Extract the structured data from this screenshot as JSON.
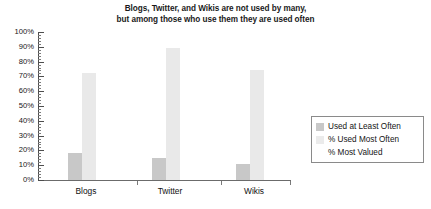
{
  "chart_data": {
    "type": "bar",
    "title": "Blogs, Twitter, and Wikis are not used by many, but among those who use them they are used often",
    "title_lines": [
      "Blogs, Twitter, and Wikis are not used by many,",
      "but among those who use them they are used often"
    ],
    "categories": [
      "Blogs",
      "Twitter",
      "Wikis"
    ],
    "series": [
      {
        "name": "Used at Least Often",
        "color": "#c8c8c8",
        "values": [
          18,
          15,
          11
        ]
      },
      {
        "name": "% Used Most Often",
        "color": "#e9e9e9",
        "values": [
          72,
          89,
          74
        ]
      },
      {
        "name": "% Most Valued",
        "color": "#ffffff",
        "values": [
          0,
          0,
          0
        ]
      }
    ],
    "xlabel": "",
    "ylabel": "",
    "ylim": [
      0,
      100
    ],
    "ytick_labels": [
      "100%",
      "90%",
      "80%",
      "70%",
      "60%",
      "50%",
      "40%",
      "30%",
      "20%",
      "10%",
      "0%"
    ],
    "ytick_values": [
      100,
      90,
      80,
      70,
      60,
      50,
      40,
      30,
      20,
      10,
      0
    ],
    "yminor_step": 2,
    "grid": false,
    "legend_position": "right"
  },
  "legend": {
    "entries": [
      {
        "label": "Used at Least Often",
        "swatch": "#c8c8c8"
      },
      {
        "label": "% Used Most Often",
        "swatch": "#ebebeb"
      },
      {
        "label": "% Most Valued",
        "swatch": "#ffffff"
      }
    ]
  }
}
